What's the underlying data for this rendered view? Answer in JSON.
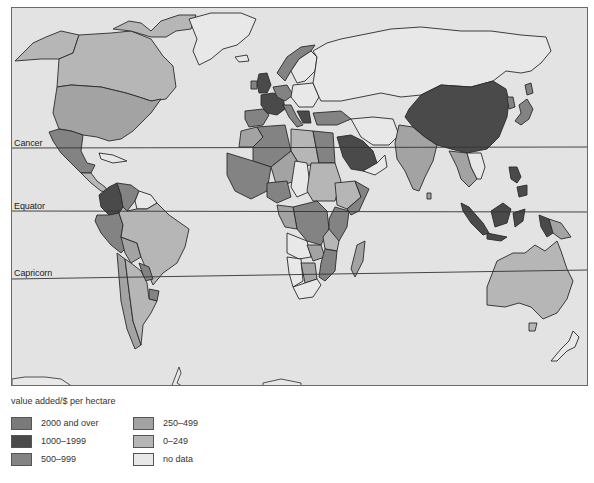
{
  "map": {
    "lines": [
      {
        "label": "Cancer",
        "y_left": 147,
        "y_right": 146
      },
      {
        "label": "Equator",
        "y_left": 210,
        "y_right": 211
      },
      {
        "label": "Capricorn",
        "y_left": 278,
        "y_right": 269
      }
    ],
    "background_color": "#e3e3e3"
  },
  "legend": {
    "title": "value added/$ per hectare",
    "items": [
      {
        "label": "2000 and over",
        "color": "#7a7a7a"
      },
      {
        "label": "1000–1999",
        "color": "#4a4a4a"
      },
      {
        "label": "500–999",
        "color": "#838383"
      },
      {
        "label": "250–499",
        "color": "#a3a3a3"
      },
      {
        "label": "0–249",
        "color": "#b6b6b6"
      },
      {
        "label": "no data",
        "color": "#e8e8e8"
      }
    ]
  },
  "regions": [
    {
      "name": "Canada",
      "category": "0–249"
    },
    {
      "name": "Alaska",
      "category": "0–249"
    },
    {
      "name": "USA",
      "category": "250–499"
    },
    {
      "name": "Greenland",
      "category": "no data"
    },
    {
      "name": "Mexico",
      "category": "500–999"
    },
    {
      "name": "Colombia",
      "category": "1000–1999"
    },
    {
      "name": "Venezuela",
      "category": "500–999"
    },
    {
      "name": "Guianas",
      "category": "no data"
    },
    {
      "name": "Brazil",
      "category": "0–249"
    },
    {
      "name": "Peru",
      "category": "500–999"
    },
    {
      "name": "Chile",
      "category": "250–499"
    },
    {
      "name": "Argentina",
      "category": "0–249"
    },
    {
      "name": "Paraguay",
      "category": "500–999"
    },
    {
      "name": "Uruguay",
      "category": "500–999"
    },
    {
      "name": "UK",
      "category": "1000–1999"
    },
    {
      "name": "France",
      "category": "1000–1999"
    },
    {
      "name": "Spain",
      "category": "500–999"
    },
    {
      "name": "Italy",
      "category": "500–999"
    },
    {
      "name": "Norway",
      "category": "500–999"
    },
    {
      "name": "Sweden",
      "category": "no data"
    },
    {
      "name": "USSR",
      "category": "no data"
    },
    {
      "name": "Turkey",
      "category": "500–999"
    },
    {
      "name": "Saudi Arabia",
      "category": "1000–1999"
    },
    {
      "name": "Iran",
      "category": "no data"
    },
    {
      "name": "India",
      "category": "250–499"
    },
    {
      "name": "China",
      "category": "1000–1999"
    },
    {
      "name": "Japan",
      "category": "500–999"
    },
    {
      "name": "Indonesia",
      "category": "1000–1999"
    },
    {
      "name": "Papua New Guinea",
      "category": "250–499"
    },
    {
      "name": "Australia",
      "category": "0–249"
    },
    {
      "name": "New Zealand",
      "category": "no data"
    },
    {
      "name": "Algeria",
      "category": "500–999"
    },
    {
      "name": "Libya",
      "category": "0–249"
    },
    {
      "name": "Egypt",
      "category": "500–999"
    },
    {
      "name": "Sudan",
      "category": "0–249"
    },
    {
      "name": "Zaire",
      "category": "500–999"
    },
    {
      "name": "Angola",
      "category": "no data"
    },
    {
      "name": "South Africa",
      "category": "no data"
    },
    {
      "name": "Madagascar",
      "category": "250–499"
    }
  ]
}
